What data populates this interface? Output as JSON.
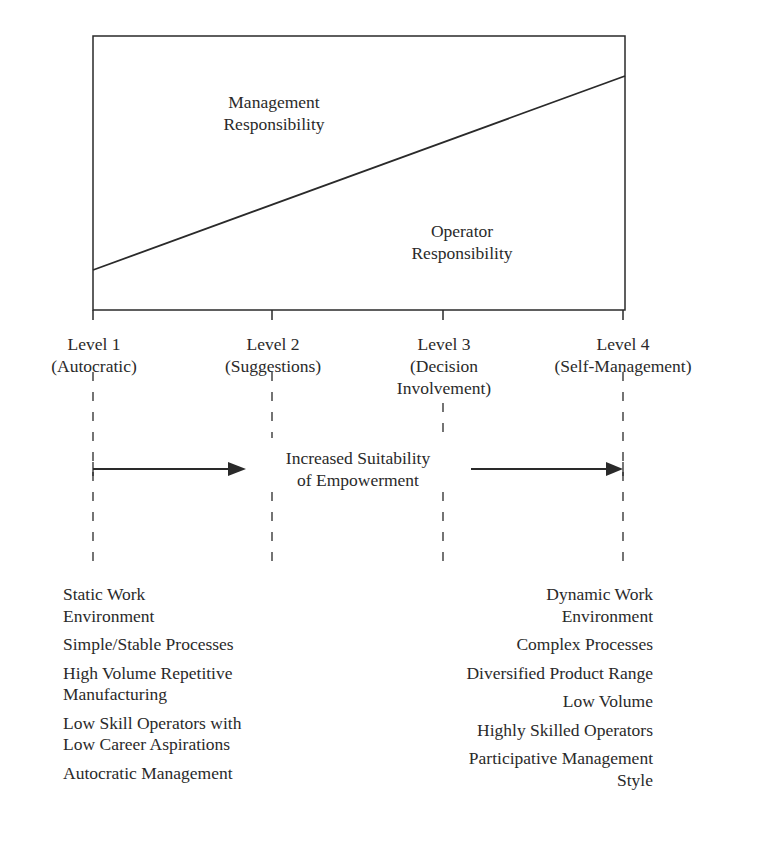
{
  "regions": {
    "upper_label": "Management\nResponsibility",
    "lower_label": "Operator\nResponsibility"
  },
  "levels": [
    {
      "name": "Level 1",
      "desc": "(Autocratic)"
    },
    {
      "name": "Level 2",
      "desc": "(Suggestions)"
    },
    {
      "name": "Level 3",
      "desc": "(Decision\nInvolvement)"
    },
    {
      "name": "Level 4",
      "desc": "(Self-Management)"
    }
  ],
  "arrow_label": "Increased Suitability\nof Empowerment",
  "left_characteristics": [
    "Static Work\nEnvironment",
    "Simple/Stable Processes",
    "High Volume Repetitive\nManufacturing",
    "Low Skill Operators with\nLow Career Aspirations",
    "Autocratic Management"
  ],
  "right_characteristics": [
    "Dynamic Work\nEnvironment",
    "Complex Processes",
    "Diversified Product Range",
    "Low Volume",
    "Highly Skilled Operators",
    "Participative Management\nStyle"
  ],
  "colors": {
    "line": "#2a2a2a",
    "background": "#ffffff"
  }
}
